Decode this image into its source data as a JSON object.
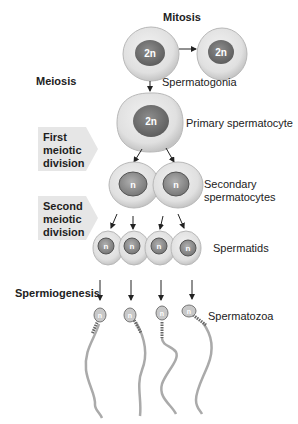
{
  "labels": {
    "mitosis": "Mitosis",
    "meiosis": "Meiosis",
    "spermiogenesis": "Spermiogenesis"
  },
  "stages": [
    {
      "id": "first",
      "lines": [
        "First",
        "meiotic",
        "division"
      ]
    },
    {
      "id": "second",
      "lines": [
        "Second",
        "meiotic",
        "division"
      ]
    }
  ],
  "cells": {
    "spermatogonia": {
      "label": "Spermatogonia",
      "ploidy": "2n",
      "count": 2
    },
    "primary": {
      "label": "Primary spermatocyte",
      "ploidy": "2n",
      "count": 1
    },
    "secondary": {
      "label_line1": "Secondary",
      "label_line2": "spermatocytes",
      "ploidy": "n",
      "count": 2
    },
    "spermatids": {
      "label": "Spermatids",
      "ploidy": "n",
      "count": 4
    },
    "spermatozoa": {
      "label": "Spermatozoa",
      "ploidy": "n",
      "count": 4
    }
  },
  "colors": {
    "cytoplasm": "#e3e3e3",
    "cell_edge": "#b5b5b5",
    "nucleus": "#777777",
    "stage_box": "#e6e6e6"
  }
}
